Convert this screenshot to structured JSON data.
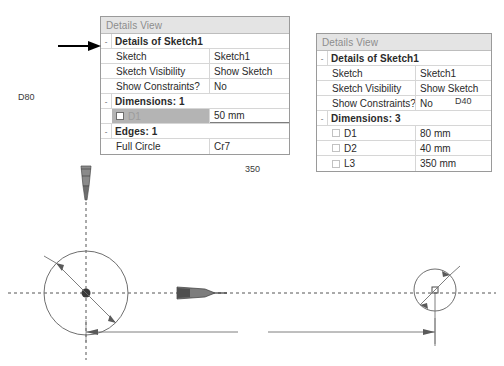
{
  "panels": [
    {
      "id": "panel-a",
      "header": "Details View",
      "rows": [
        {
          "kind": "group",
          "label": "Details of Sketch1",
          "expander": "-"
        },
        {
          "kind": "pair",
          "label": "Sketch",
          "value": "Sketch1"
        },
        {
          "kind": "pair",
          "label": "Sketch Visibility",
          "value": "Show Sketch"
        },
        {
          "kind": "pair",
          "label": "Show Constraints?",
          "value": "No"
        },
        {
          "kind": "group",
          "label": "Dimensions: 1",
          "expander": "-"
        },
        {
          "kind": "pair",
          "label": "D1",
          "value": "50 mm",
          "checkbox": true,
          "selected": true
        },
        {
          "kind": "group",
          "label": "Edges: 1",
          "expander": "-"
        },
        {
          "kind": "pair",
          "label": "Full Circle",
          "value": "Cr7"
        }
      ]
    },
    {
      "id": "panel-b",
      "header": "Details View",
      "rows": [
        {
          "kind": "group",
          "label": "Details of Sketch1",
          "expander": "-"
        },
        {
          "kind": "pair",
          "label": "Sketch",
          "value": "Sketch1"
        },
        {
          "kind": "pair",
          "label": "Sketch Visibility",
          "value": "Show Sketch"
        },
        {
          "kind": "pair",
          "label": "Show Constraints?",
          "value": "No"
        },
        {
          "kind": "group",
          "label": "Dimensions: 3",
          "expander": "-"
        },
        {
          "kind": "pair",
          "label": "D1",
          "value": "80 mm",
          "checkbox": true
        },
        {
          "kind": "pair",
          "label": "D2",
          "value": "40 mm",
          "checkbox": true
        },
        {
          "kind": "pair",
          "label": "L3",
          "value": "350 mm",
          "checkbox": true
        }
      ]
    }
  ],
  "annotation": {
    "arrow_name": "pointer-arrow",
    "points_at": "Details of Sketch1"
  },
  "drawing": {
    "labels": {
      "left_diameter": "D80",
      "right_diameter": "D40",
      "length": "350"
    },
    "colors": {
      "geometry": "#6f6f6f",
      "axis": "#555555",
      "dimension": "#555555",
      "marker": "#3a3a3a"
    },
    "geometry": {
      "left_circle": {
        "cx": 86,
        "cy": 133,
        "r": 42,
        "diameter_mm": 80
      },
      "right_circle": {
        "cx": 435,
        "cy": 130,
        "r": 21,
        "diameter_mm": 40
      },
      "length_mm": 350,
      "dimension_line_y": 172
    }
  }
}
